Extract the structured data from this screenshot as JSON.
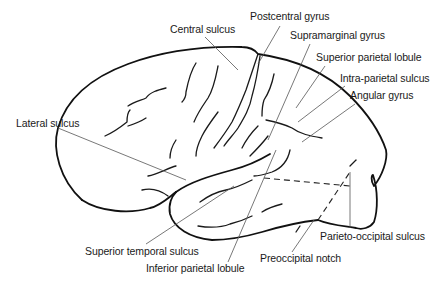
{
  "diagram": {
    "labels": [
      {
        "id": "central-sulcus",
        "text": "Central sulcus",
        "x": 170,
        "y": 25
      },
      {
        "id": "postcentral-gyrus",
        "text": "Postcentral gyrus",
        "x": 250,
        "y": 12
      },
      {
        "id": "supramarginal-gyrus",
        "text": "Supramarginal gyrus",
        "x": 290,
        "y": 30
      },
      {
        "id": "superior-parietal-lobule",
        "text": "Superior parietal lobule",
        "x": 315,
        "y": 53
      },
      {
        "id": "intra-parietal-sulcus",
        "text": "Intra-parietal sulcus",
        "x": 340,
        "y": 73
      },
      {
        "id": "angular-gyrus",
        "text": "Angular gyrus",
        "x": 350,
        "y": 90
      },
      {
        "id": "lateral-sulcus",
        "text": "Lateral sulcus",
        "x": 16,
        "y": 118
      },
      {
        "id": "parieto-occipital-sulcus",
        "text": "Parieto-occipital sulcus",
        "x": 320,
        "y": 230
      },
      {
        "id": "preoccipital-notch",
        "text": "Preoccipital notch",
        "x": 260,
        "y": 253
      },
      {
        "id": "superior-temporal-sulcus",
        "text": "Superior temporal sulcus",
        "x": 85,
        "y": 244
      },
      {
        "id": "inferior-parietal-lobule",
        "text": "Inferior parietal lobule",
        "x": 146,
        "y": 262
      }
    ]
  }
}
